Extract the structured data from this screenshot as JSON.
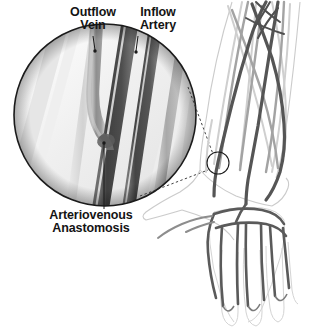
{
  "figure": {
    "background_color": "#ffffff",
    "view": "anterior view of right forearm and hand with magnified inset"
  },
  "labels": {
    "outflow_vein": "Outflow\nVein",
    "inflow_artery": "Inflow\nArtery",
    "anastomosis": "Arteriovenous\nAnastomosis"
  },
  "colors": {
    "text": "#141414",
    "leader_line": "#1a1a1a",
    "circle_border": "#1b1b1b",
    "artery_dark": "#4a4a4a",
    "artery_darkest": "#3a3a3a",
    "vein_mid": "#8f8f8f",
    "vein_light": "#b5b5b5",
    "vessel_faint": "#c9c9c9",
    "skin_outline": "#bdbdbd",
    "inset_fill": "#f2f2f2"
  },
  "inset": {
    "shape": "circle",
    "center_x": 105,
    "center_y": 115,
    "radius": 92,
    "contents": "magnified arteriovenous anastomosis showing outflow vein joining inflow artery"
  },
  "marker": {
    "shape": "circle",
    "center_x": 218,
    "center_y": 163,
    "radius": 11,
    "meaning": "fistula site on wrist"
  },
  "connectors": [
    {
      "name": "inset-to-marker-upper",
      "style": "dashed"
    },
    {
      "name": "inset-to-marker-lower",
      "style": "dashed"
    }
  ],
  "leaders": [
    {
      "name": "outflow-vein-leader",
      "from_label": "outflow_vein",
      "to_x": 95,
      "to_y": 52
    },
    {
      "name": "inflow-artery-leader",
      "from_label": "inflow_artery",
      "to_x": 136,
      "to_y": 53
    },
    {
      "name": "anastomosis-leader",
      "from_label": "anastomosis",
      "to_x": 104,
      "to_y": 143
    }
  ]
}
